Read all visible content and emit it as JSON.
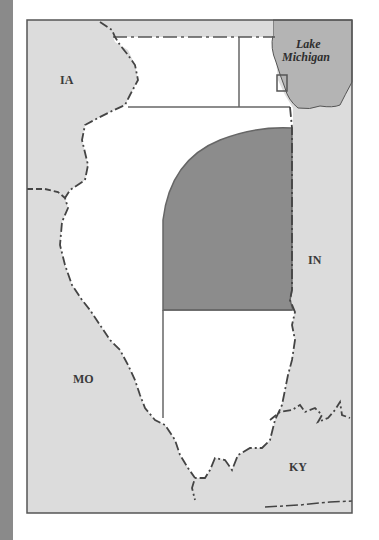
{
  "map": {
    "labels": {
      "iowa": "IA",
      "missouri": "MO",
      "indiana": "IN",
      "kentucky": "KY",
      "lake_line1": "Lake",
      "lake_line2": "Michigan"
    },
    "colors": {
      "side_strip": "#8a8a8a",
      "neighbor_land": "#dcdcdc",
      "illinois": "#ffffff",
      "highlight_region": "#8c8c8c",
      "lake": "#b4b4b4",
      "border_line": "#555555",
      "frame": "#555555"
    },
    "features": [
      "Illinois state outline (white)",
      "Shaded east-central region bounded by a curved western edge",
      "Small rectangle marking Chicago area near Lake Michigan",
      "Dashed state boundaries along rivers"
    ]
  }
}
